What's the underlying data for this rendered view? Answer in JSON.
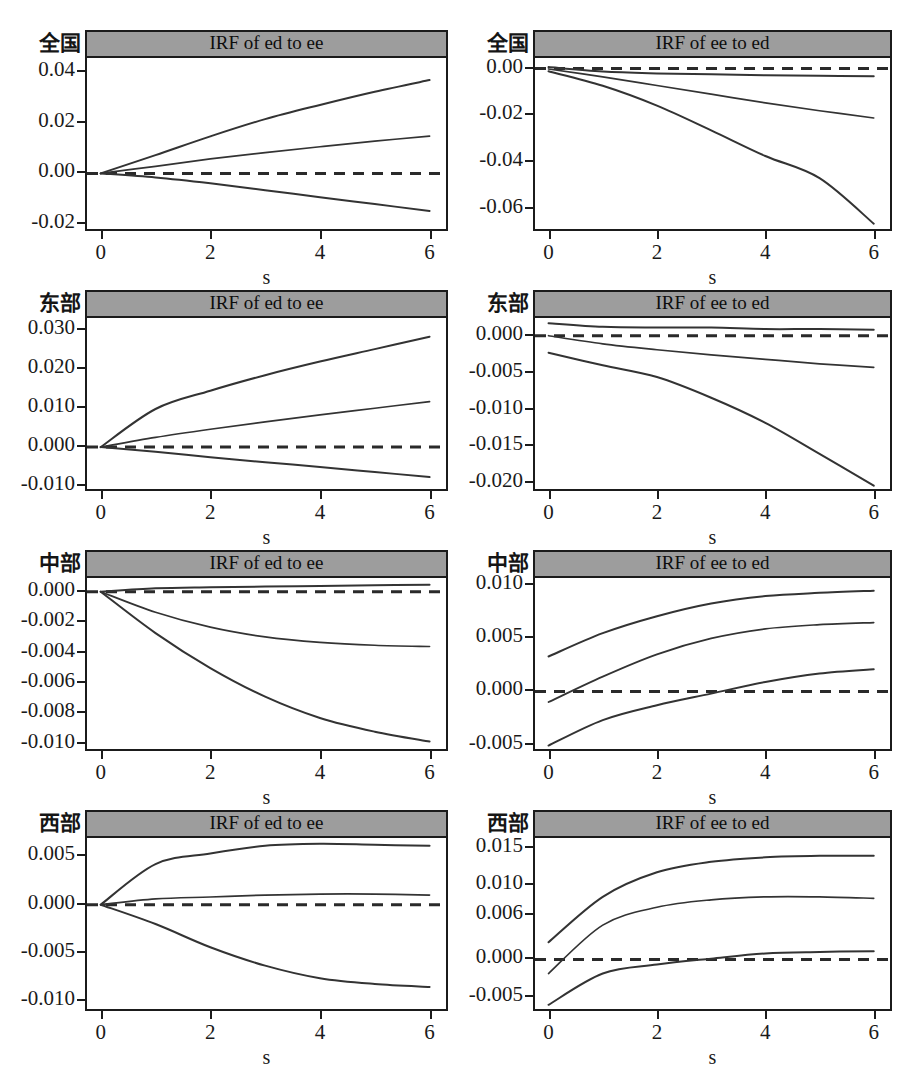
{
  "figure": {
    "width": 924,
    "height": 1066,
    "background": "#ffffff",
    "title_bar_color": "#9d9d9d",
    "line_color": "#333333",
    "axis_color": "#1b1b1b",
    "xaxis_title": "s",
    "rows": 4,
    "cols": 2
  },
  "chart_data": [
    {
      "type": "line",
      "panel_index": 0,
      "row": 0,
      "col": 0,
      "region": "全国",
      "title": "IRF of ed to ee",
      "xlabel": "s",
      "ylabel": "",
      "x": [
        0,
        1,
        2,
        3,
        4,
        5,
        6
      ],
      "xlim": [
        -0.25,
        6.3
      ],
      "ylim": [
        -0.0235,
        0.0455
      ],
      "xticks": [
        0,
        2,
        4,
        6
      ],
      "xticklabels": [
        "0",
        "2",
        "4",
        "6"
      ],
      "yticks": [
        0.04,
        0.02,
        0.0,
        -0.02
      ],
      "yticklabels": [
        "0.04",
        "0.02",
        "0.00",
        "-0.02"
      ],
      "grid": false,
      "zero_line": {
        "value": 0.0,
        "style": "dashed"
      },
      "series": [
        {
          "name": "upper 95% CI",
          "values": [
            0.0,
            0.0072,
            0.0146,
            0.0214,
            0.027,
            0.0322,
            0.0368
          ]
        },
        {
          "name": "impulse response",
          "values": [
            0.0,
            0.0028,
            0.0057,
            0.0082,
            0.0105,
            0.0127,
            0.0147
          ]
        },
        {
          "name": "lower 95% CI",
          "values": [
            0.0,
            -0.0016,
            -0.0039,
            -0.0066,
            -0.0094,
            -0.0121,
            -0.0148
          ]
        }
      ]
    },
    {
      "type": "line",
      "panel_index": 1,
      "row": 0,
      "col": 1,
      "region": "全国",
      "title": "IRF of ee to ed",
      "xlabel": "s",
      "ylabel": "",
      "x": [
        0,
        1,
        2,
        3,
        4,
        5,
        6
      ],
      "xlim": [
        -0.25,
        6.3
      ],
      "ylim": [
        -0.0705,
        0.0045
      ],
      "xticks": [
        0,
        2,
        4,
        6
      ],
      "xticklabels": [
        "0",
        "2",
        "4",
        "6"
      ],
      "yticks": [
        0.0,
        -0.02,
        -0.04,
        -0.06
      ],
      "yticklabels": [
        "0.00",
        "-0.02",
        "-0.04",
        "-0.06"
      ],
      "grid": false,
      "zero_line": {
        "value": 0.0,
        "style": "dashed"
      },
      "series": [
        {
          "name": "upper 95% CI",
          "values": [
            0.0006,
            -0.0013,
            -0.0021,
            -0.0025,
            -0.0029,
            -0.0031,
            -0.0033
          ]
        },
        {
          "name": "impulse response",
          "values": [
            -0.0002,
            -0.0036,
            -0.0073,
            -0.011,
            -0.0147,
            -0.0181,
            -0.0212
          ]
        },
        {
          "name": "lower 95% CI",
          "values": [
            -0.0012,
            -0.0074,
            -0.0159,
            -0.0265,
            -0.0375,
            -0.047,
            -0.0665
          ]
        }
      ]
    },
    {
      "type": "line",
      "panel_index": 2,
      "row": 1,
      "col": 0,
      "region": "东部",
      "title": "IRF of ed to ee",
      "xlabel": "s",
      "ylabel": "",
      "x": [
        0,
        1,
        2,
        3,
        4,
        5,
        6
      ],
      "xlim": [
        -0.25,
        6.3
      ],
      "ylim": [
        -0.0118,
        0.0332
      ],
      "xticks": [
        0,
        2,
        4,
        6
      ],
      "xticklabels": [
        "0",
        "2",
        "4",
        "6"
      ],
      "yticks": [
        0.03,
        0.02,
        0.01,
        0.0,
        -0.01
      ],
      "yticklabels": [
        "0.030",
        "0.020",
        "0.010",
        "0.000",
        "-0.010"
      ],
      "grid": false,
      "zero_line": {
        "value": 0.0,
        "style": "dashed"
      },
      "series": [
        {
          "name": "upper 95% CI",
          "values": [
            0.0,
            0.0098,
            0.0145,
            0.0185,
            0.022,
            0.0252,
            0.0284
          ]
        },
        {
          "name": "impulse response",
          "values": [
            0.0,
            0.0025,
            0.0046,
            0.0065,
            0.0083,
            0.01,
            0.0117
          ]
        },
        {
          "name": "lower 95% CI",
          "values": [
            0.0,
            -0.0012,
            -0.0026,
            -0.0039,
            -0.0051,
            -0.0064,
            -0.0077
          ]
        }
      ]
    },
    {
      "type": "line",
      "panel_index": 3,
      "row": 1,
      "col": 1,
      "region": "东部",
      "title": "IRF of ee to ed",
      "xlabel": "s",
      "ylabel": "",
      "x": [
        0,
        1,
        2,
        3,
        4,
        5,
        6
      ],
      "xlim": [
        -0.25,
        6.3
      ],
      "ylim": [
        -0.0213,
        0.0024
      ],
      "xticks": [
        0,
        2,
        4,
        6
      ],
      "xticklabels": [
        "0",
        "2",
        "4",
        "6"
      ],
      "yticks": [
        0.0,
        -0.005,
        -0.01,
        -0.015,
        -0.02
      ],
      "yticklabels": [
        "0.000",
        "-0.005",
        "-0.010",
        "-0.015",
        "-0.020"
      ],
      "grid": false,
      "zero_line": {
        "value": 0.0,
        "style": "dashed"
      },
      "series": [
        {
          "name": "upper 95% CI",
          "values": [
            0.0017,
            0.0012,
            0.0011,
            0.0011,
            0.0009,
            0.0009,
            0.0008
          ]
        },
        {
          "name": "impulse response",
          "values": [
            0.0,
            -0.0011,
            -0.0019,
            -0.0026,
            -0.0032,
            -0.0038,
            -0.0043
          ]
        },
        {
          "name": "lower 95% CI",
          "values": [
            -0.0023,
            -0.004,
            -0.0056,
            -0.0084,
            -0.0118,
            -0.016,
            -0.0203
          ]
        }
      ]
    },
    {
      "type": "line",
      "panel_index": 4,
      "row": 2,
      "col": 0,
      "region": "中部",
      "title": "IRF of ed to ee",
      "xlabel": "s",
      "ylabel": "",
      "x": [
        0,
        1,
        2,
        3,
        4,
        5,
        6
      ],
      "xlim": [
        -0.25,
        6.3
      ],
      "ylim": [
        -0.0106,
        0.0009
      ],
      "xticks": [
        0,
        2,
        4,
        6
      ],
      "xticklabels": [
        "0",
        "2",
        "4",
        "6"
      ],
      "yticks": [
        0.0,
        -0.002,
        -0.004,
        -0.006,
        -0.008,
        -0.01
      ],
      "yticklabels": [
        "0.000",
        "-0.002",
        "-0.004",
        "-0.006",
        "-0.008",
        "-0.010"
      ],
      "grid": false,
      "zero_line": {
        "value": 0.0,
        "style": "dashed"
      },
      "series": [
        {
          "name": "upper 95% CI",
          "values": [
            0.0,
            0.00022,
            0.00029,
            0.00034,
            0.00038,
            0.00042,
            0.00046
          ]
        },
        {
          "name": "impulse response",
          "values": [
            0.0,
            -0.00135,
            -0.00233,
            -0.00297,
            -0.00333,
            -0.00352,
            -0.0036
          ]
        },
        {
          "name": "lower 95% CI",
          "values": [
            0.0,
            -0.00272,
            -0.00502,
            -0.0069,
            -0.0083,
            -0.0092,
            -0.00985
          ]
        }
      ]
    },
    {
      "type": "line",
      "panel_index": 5,
      "row": 2,
      "col": 1,
      "region": "中部",
      "title": "IRF of ee to ed",
      "xlabel": "s",
      "ylabel": "",
      "x": [
        0,
        1,
        2,
        3,
        4,
        5,
        6
      ],
      "xlim": [
        -0.25,
        6.3
      ],
      "ylim": [
        -0.0058,
        0.0107
      ],
      "xticks": [
        0,
        2,
        4,
        6
      ],
      "xticklabels": [
        "0",
        "2",
        "4",
        "6"
      ],
      "yticks": [
        0.01,
        0.005,
        0.0,
        -0.005
      ],
      "yticklabels": [
        "0.010",
        "0.005",
        "0.000",
        "-0.005"
      ],
      "grid": false,
      "zero_line": {
        "value": 0.0,
        "style": "dashed"
      },
      "series": [
        {
          "name": "upper 95% CI",
          "values": [
            0.0033,
            0.0055,
            0.0071,
            0.0083,
            0.009,
            0.0093,
            0.0095
          ]
        },
        {
          "name": "impulse response",
          "values": [
            -0.001,
            0.0014,
            0.0035,
            0.005,
            0.0059,
            0.0063,
            0.0065
          ]
        },
        {
          "name": "lower 95% CI",
          "values": [
            -0.0051,
            -0.0027,
            -0.0013,
            -0.0002,
            0.0009,
            0.0017,
            0.0021
          ]
        }
      ]
    },
    {
      "type": "line",
      "panel_index": 6,
      "row": 3,
      "col": 0,
      "region": "西部",
      "title": "IRF of ed to ee",
      "xlabel": "s",
      "ylabel": "",
      "x": [
        0,
        1,
        2,
        3,
        4,
        5,
        6
      ],
      "xlim": [
        -0.25,
        6.3
      ],
      "ylim": [
        -0.0112,
        0.0069
      ],
      "xticks": [
        0,
        2,
        4,
        6
      ],
      "xticklabels": [
        "0",
        "2",
        "4",
        "6"
      ],
      "yticks": [
        0.005,
        0.0,
        -0.005,
        -0.01
      ],
      "yticklabels": [
        "0.005",
        "0.000",
        "-0.005",
        "-0.010"
      ],
      "grid": false,
      "zero_line": {
        "value": 0.0,
        "style": "dashed"
      },
      "series": [
        {
          "name": "upper 95% CI",
          "values": [
            0.0,
            0.0042,
            0.0053,
            0.0061,
            0.0063,
            0.0062,
            0.0061
          ]
        },
        {
          "name": "impulse response",
          "values": [
            0.0,
            0.0006,
            0.0008,
            0.001,
            0.0011,
            0.0011,
            0.001
          ]
        },
        {
          "name": "lower 95% CI",
          "values": [
            0.0,
            -0.002,
            -0.0044,
            -0.0063,
            -0.0076,
            -0.0082,
            -0.0085
          ]
        }
      ]
    },
    {
      "type": "line",
      "panel_index": 7,
      "row": 3,
      "col": 1,
      "region": "西部",
      "title": "IRF of ee to ed",
      "xlabel": "s",
      "ylabel": "",
      "x": [
        0,
        1,
        2,
        3,
        4,
        5,
        6
      ],
      "xlim": [
        -0.25,
        6.3
      ],
      "ylim": [
        -0.0072,
        0.0163
      ],
      "xticks": [
        0,
        2,
        4,
        6
      ],
      "xticklabels": [
        "0",
        "2",
        "4",
        "6"
      ],
      "yticks": [
        0.015,
        0.01,
        0.006,
        0.0,
        -0.005
      ],
      "yticklabels": [
        "0.015",
        "0.010",
        "0.006",
        "0.000",
        "-0.005"
      ],
      "grid": false,
      "zero_line": {
        "value": 0.0,
        "style": "dashed"
      },
      "series": [
        {
          "name": "upper 95% CI",
          "values": [
            0.0023,
            0.0084,
            0.0117,
            0.0131,
            0.0137,
            0.0139,
            0.0139
          ]
        },
        {
          "name": "impulse response",
          "values": [
            -0.0019,
            0.0046,
            0.007,
            0.008,
            0.0084,
            0.0084,
            0.0082
          ]
        },
        {
          "name": "lower 95% CI",
          "values": [
            -0.0061,
            -0.0019,
            -0.0007,
            0.0001,
            0.0008,
            0.001,
            0.0011
          ]
        }
      ]
    }
  ]
}
